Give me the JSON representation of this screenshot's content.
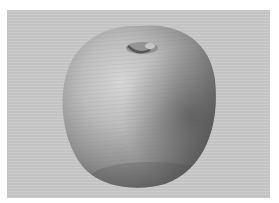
{
  "image": {
    "subject": "pencil sketch of an apple",
    "colors": {
      "border": "#ffffff",
      "paper": "#c9c9c9",
      "highlight": "#d8d8d8",
      "midtone": "#a5a5a5",
      "shadow": "#5a5a5a"
    }
  }
}
